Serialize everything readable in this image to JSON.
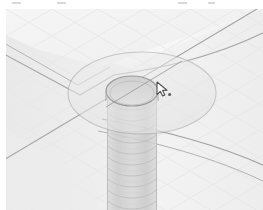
{
  "application": {
    "title": "3D CAD Viewport",
    "view_mode": "Shaded with Edges",
    "projection": "Isometric",
    "render_style": "Monochrome grayscale"
  },
  "viewport": {
    "name": "graphics-viewport",
    "width": 257,
    "height": 201,
    "background_color": "#f3f3f3",
    "grid_visible": true,
    "grid_color": "#e4e4e4",
    "edge_color": "#9a9a9a"
  },
  "model": {
    "name": "Threaded Boss Feature",
    "description": "Cylindrical threaded hole through a plate with counterbore boss",
    "features": [
      {
        "name": "plate-top-face",
        "type": "planar-face",
        "shade": "#f1f1f1"
      },
      {
        "name": "plate-corner-edge",
        "type": "chamfer-edge",
        "shade": "#ededed"
      },
      {
        "name": "counterbore-boss",
        "type": "circular-boss",
        "shade": "#eaeaea"
      },
      {
        "name": "thread-bore",
        "type": "cylindrical-bore",
        "shade": "#dcdcdc"
      },
      {
        "name": "threaded-shaft",
        "type": "helical-thread-cylinder",
        "shade": "#d2d2d2"
      }
    ]
  },
  "cursor": {
    "name": "selection-cursor",
    "type": "arrow-pointer-with-marker",
    "x": 150,
    "y": 72,
    "color": "#4a4a4a"
  },
  "colors": {
    "background": "#ffffff",
    "viewport_bg": "#f3f3f3",
    "face_light": "#f4f4f4",
    "face_mid": "#ececec",
    "face_dark": "#e0e0e0",
    "shaft": "#d4d4d4",
    "edge_line": "#9c9c9c",
    "edge_line_soft": "#b8b8b8",
    "grid": "#e6e6e6",
    "cursor": "#555555"
  },
  "toolbar_remnant": {
    "name": "top-dash-marks",
    "dashes": [
      {
        "left": 12,
        "width": 9
      },
      {
        "left": 57,
        "width": 9
      },
      {
        "left": 178,
        "width": 9
      },
      {
        "left": 208,
        "width": 7
      }
    ]
  }
}
